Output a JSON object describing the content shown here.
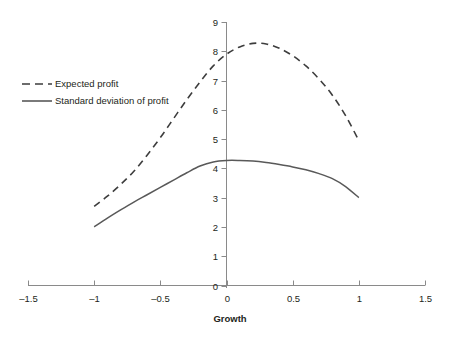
{
  "chart_data": {
    "type": "line",
    "title": "",
    "xlabel": "Growth",
    "ylabel": "",
    "xlim": [
      -1.5,
      1.5
    ],
    "ylim": [
      0,
      9
    ],
    "grid": false,
    "legend_position": "upper-left",
    "x_ticks": [
      "-1.5",
      "-1",
      "-0.5",
      "0",
      "0.5",
      "1",
      "1.5"
    ],
    "x_tick_values": [
      -1.5,
      -1,
      -0.5,
      0,
      0.5,
      1,
      1.5
    ],
    "y_ticks": [
      "0",
      "1",
      "2",
      "3",
      "4",
      "5",
      "6",
      "7",
      "8",
      "9"
    ],
    "y_tick_values": [
      0,
      1,
      2,
      3,
      4,
      5,
      6,
      7,
      8,
      9
    ],
    "x": [
      -1,
      -0.9,
      -0.8,
      -0.7,
      -0.6,
      -0.5,
      -0.4,
      -0.3,
      -0.2,
      -0.1,
      0,
      0.1,
      0.2,
      0.3,
      0.4,
      0.5,
      0.6,
      0.7,
      0.8,
      0.9,
      1
    ],
    "series": [
      {
        "name": "Expected profit",
        "style": "dashed",
        "color": "#3d3d3d",
        "values": [
          2.7,
          3.05,
          3.45,
          3.9,
          4.45,
          5.05,
          5.7,
          6.35,
          6.95,
          7.5,
          7.9,
          8.15,
          8.27,
          8.25,
          8.1,
          7.85,
          7.5,
          7.05,
          6.5,
          5.8,
          4.95
        ]
      },
      {
        "name": "Standard deviation of profit",
        "style": "solid",
        "color": "#595959",
        "values": [
          2.0,
          2.3,
          2.58,
          2.85,
          3.1,
          3.35,
          3.6,
          3.85,
          4.08,
          4.22,
          4.27,
          4.27,
          4.25,
          4.2,
          4.13,
          4.05,
          3.95,
          3.82,
          3.65,
          3.38,
          3.0
        ]
      }
    ]
  },
  "legend": {
    "items": [
      {
        "label": "Expected profit",
        "style": "dashed"
      },
      {
        "label": "Standard deviation of profit",
        "style": "solid"
      }
    ]
  },
  "axis": {
    "x_title": "Growth"
  }
}
